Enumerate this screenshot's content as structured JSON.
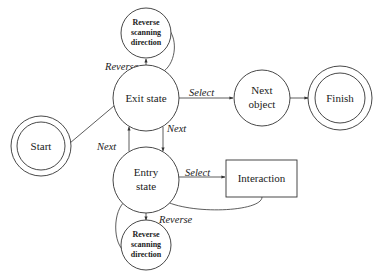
{
  "diagram": {
    "nodes": {
      "start": {
        "label": "Start",
        "type": "double-circle"
      },
      "exit_state": {
        "label": "Exit state",
        "type": "circle"
      },
      "entry_state": {
        "line1": "Entry",
        "line2": "state",
        "type": "circle"
      },
      "next_object": {
        "line1": "Next",
        "line2": "object",
        "type": "circle"
      },
      "finish": {
        "label": "Finish",
        "type": "double-circle"
      },
      "interaction": {
        "label": "Interaction",
        "type": "rectangle"
      },
      "reverse_top": {
        "line1": "Reverse",
        "line2": "scanning",
        "line3": "direction",
        "type": "circle"
      },
      "reverse_bottom": {
        "line1": "Reverse",
        "line2": "scanning",
        "line3": "direction",
        "type": "circle"
      }
    },
    "edges": [
      {
        "from": "start",
        "to": "exit_state",
        "label": ""
      },
      {
        "from": "exit_state",
        "to": "reverse_top",
        "label": "Reverse"
      },
      {
        "from": "reverse_top",
        "to": "exit_state",
        "label": ""
      },
      {
        "from": "exit_state",
        "to": "next_object",
        "label": "Select"
      },
      {
        "from": "next_object",
        "to": "finish",
        "label": ""
      },
      {
        "from": "exit_state",
        "to": "entry_state",
        "label": "Next"
      },
      {
        "from": "entry_state",
        "to": "exit_state",
        "label": "Next"
      },
      {
        "from": "entry_state",
        "to": "interaction",
        "label": "Select"
      },
      {
        "from": "interaction",
        "to": "entry_state",
        "label": ""
      },
      {
        "from": "entry_state",
        "to": "reverse_bottom",
        "label": "Reverse"
      },
      {
        "from": "reverse_bottom",
        "to": "entry_state",
        "label": ""
      }
    ],
    "labels": {
      "reverse_top": "Reverse",
      "select_top": "Select",
      "next_down": "Next",
      "next_up": "Next",
      "select_bottom": "Select",
      "reverse_bottom": "Reverse"
    }
  }
}
